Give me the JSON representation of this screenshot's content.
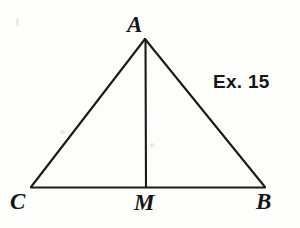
{
  "figure": {
    "type": "geometry-diagram",
    "shape": "isosceles-triangle-with-median",
    "background_color": "#fdfdfc",
    "stroke_color": "#1a1a1a",
    "stroke_width": 2,
    "caption": "Ex. 15",
    "vertices": [
      {
        "id": "A",
        "label": "A",
        "x": 145,
        "y": 39,
        "label_x": 127,
        "label_y": 13
      },
      {
        "id": "C",
        "label": "C",
        "x": 31,
        "y": 187,
        "label_x": 10,
        "label_y": 190
      },
      {
        "id": "B",
        "label": "B",
        "x": 265,
        "y": 187,
        "label_x": 256,
        "label_y": 190
      },
      {
        "id": "M",
        "label": "M",
        "x": 146,
        "y": 187,
        "label_x": 134,
        "label_y": 191
      }
    ],
    "segments": [
      {
        "name": "side-AC",
        "from": "A",
        "to": "C"
      },
      {
        "name": "side-AB",
        "from": "A",
        "to": "B"
      },
      {
        "name": "base-CB",
        "from": "C",
        "to": "B"
      },
      {
        "name": "median-AM",
        "from": "A",
        "to": "M"
      }
    ]
  }
}
